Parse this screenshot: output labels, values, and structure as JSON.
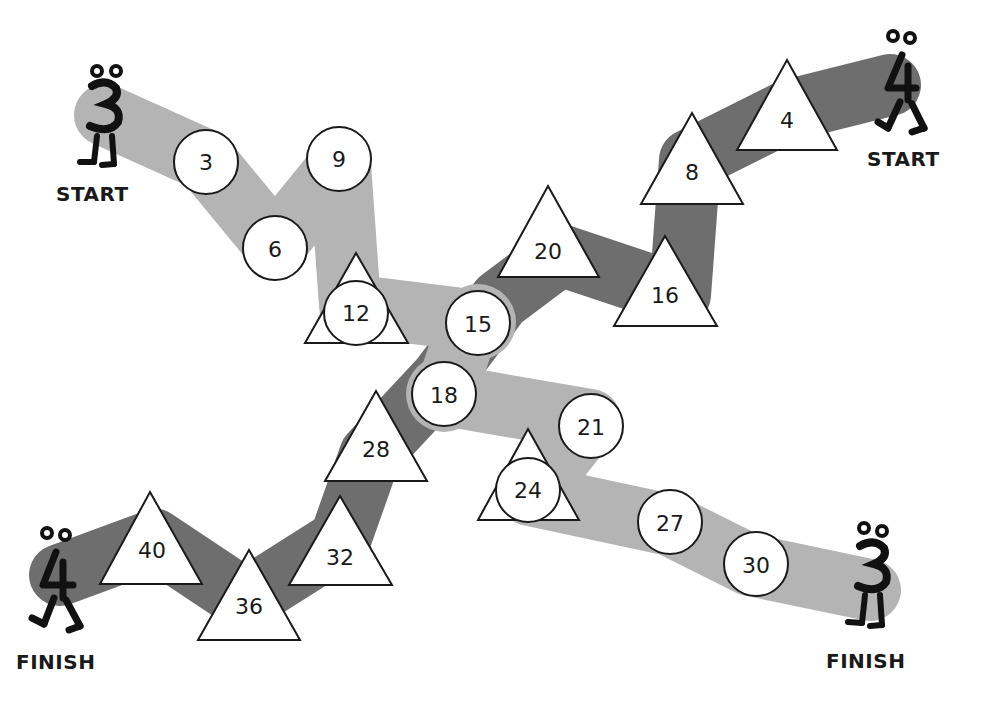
{
  "colors": {
    "path_threes": "#b4b4b4",
    "path_fours": "#6e6e6e",
    "space_fill": "#ffffff",
    "outline": "#1a1a1a"
  },
  "paths": {
    "threes": {
      "character": "3",
      "start_label": "START",
      "finish_label": "FINISH",
      "shape": "circle",
      "spaces": [
        "3",
        "6",
        "9",
        "12",
        "15",
        "18",
        "21",
        "24",
        "27",
        "30"
      ]
    },
    "fours": {
      "character": "4",
      "start_label": "START",
      "finish_label": "FINISH",
      "shape": "triangle",
      "spaces": [
        "4",
        "8",
        "16",
        "20",
        "28",
        "32",
        "36",
        "40"
      ]
    }
  },
  "spaces": {
    "s3": "3",
    "s6": "6",
    "s9": "9",
    "s12": "12",
    "s15": "15",
    "s18": "18",
    "s21": "21",
    "s24": "24",
    "s27": "27",
    "s30": "30",
    "s4": "4",
    "s8": "8",
    "s16": "16",
    "s20": "20",
    "s28": "28",
    "s32": "32",
    "s36": "36",
    "s40": "40"
  },
  "labels": {
    "start_left": "START",
    "start_right": "START",
    "finish_left": "FINISH",
    "finish_right": "FINISH"
  },
  "characters": {
    "three_start": "3",
    "four_start": "4",
    "four_finish": "4",
    "three_finish": "3"
  }
}
